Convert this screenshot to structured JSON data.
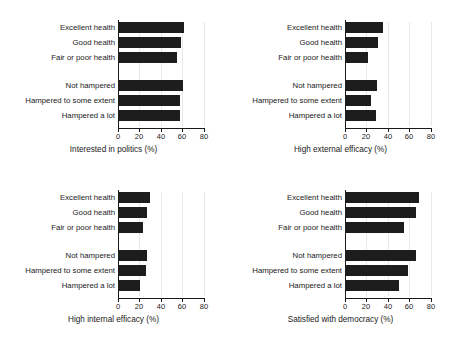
{
  "figure": {
    "title": "",
    "panel_count": 4,
    "background": "#ffffff",
    "bar_color": "#1d1d1d",
    "axis_color": "#1a1a1a",
    "grid_color": "#e8e8e8"
  },
  "categories": [
    "Excellent health",
    "Good health",
    "Fair or poor health",
    "Not hampered",
    "Hampered to some extent",
    "Hampered a lot"
  ],
  "ticks": [
    "0",
    "20",
    "40",
    "60",
    "80"
  ],
  "tick_values": [
    0,
    20,
    40,
    60,
    80
  ],
  "panels": [
    {
      "id": "interested-in-politics",
      "xlabel": "Interested in politics (%)",
      "values": [
        61,
        59,
        55,
        60,
        58,
        58
      ]
    },
    {
      "id": "high-external-efficacy",
      "xlabel": "High external efficacy (%)",
      "values": [
        35,
        31,
        21,
        30,
        24,
        29
      ]
    },
    {
      "id": "high-internal-efficacy",
      "xlabel": "High internal efficacy (%)",
      "values": [
        30,
        27,
        23,
        27,
        26,
        20
      ]
    },
    {
      "id": "satisfied-with-democracy",
      "xlabel": "Satisfied with democracy (%)",
      "values": [
        69,
        66,
        55,
        66,
        59,
        50
      ]
    }
  ],
  "chart_data": {
    "type": "bar",
    "orientation": "horizontal",
    "title": "",
    "subtitle": "",
    "grid": true,
    "legend": null,
    "xlim": [
      0,
      85
    ],
    "xticks": [
      0,
      20,
      40,
      60,
      80
    ],
    "categories": [
      "Excellent health",
      "Good health",
      "Fair or poor health",
      "Not hampered",
      "Hampered to some extent",
      "Hampered a lot"
    ],
    "panels": [
      {
        "position": "top-left",
        "xlabel": "Interested in politics (%)",
        "ylabel": "",
        "values": [
          61,
          59,
          55,
          60,
          58,
          58
        ]
      },
      {
        "position": "top-right",
        "xlabel": "High external efficacy (%)",
        "ylabel": "",
        "values": [
          35,
          31,
          21,
          30,
          24,
          29
        ]
      },
      {
        "position": "bottom-left",
        "xlabel": "High internal efficacy (%)",
        "ylabel": "",
        "values": [
          30,
          27,
          23,
          27,
          26,
          20
        ]
      },
      {
        "position": "bottom-right",
        "xlabel": "Satisfied with democracy (%)",
        "ylabel": "",
        "values": [
          69,
          66,
          55,
          66,
          59,
          50
        ]
      }
    ]
  }
}
